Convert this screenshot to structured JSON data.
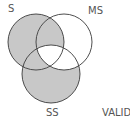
{
  "diagram": {
    "type": "venn-3",
    "colors": {
      "shade": "#c8c8c8",
      "stroke": "#3a3a3a",
      "background": "#ffffff",
      "label": "#555555"
    },
    "circles": [
      {
        "id": "S",
        "label": "S",
        "cx": 36,
        "cy": 42,
        "r": 28
      },
      {
        "id": "MS",
        "label": "MS",
        "cx": 64,
        "cy": 42,
        "r": 28
      },
      {
        "id": "SS",
        "label": "SS",
        "cx": 51,
        "cy": 74,
        "r": 29
      }
    ],
    "shaded_regions": [
      "S only",
      "S∩MS not SS",
      "S∩SS not MS",
      "SS only"
    ],
    "unshaded_regions": [
      "MS only",
      "MS∩SS not S",
      "S∩MS∩SS"
    ],
    "verdict_label": "VALID"
  }
}
